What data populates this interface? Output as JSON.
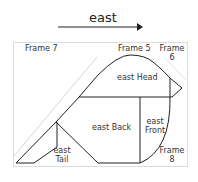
{
  "direction": {
    "label": "east"
  },
  "frames": {
    "frame7": "Frame 7",
    "frame5": "Frame 5",
    "frame6_line1": "Frame",
    "frame6_line2": "6",
    "frame8_line1": "Frame",
    "frame8_line2": "8"
  },
  "regions": {
    "head": "east Head",
    "back": "east Back",
    "front_line1": "east",
    "front_line2": "Front",
    "tail_line1": "east",
    "tail_line2": "Tail"
  },
  "colors": {
    "stroke": "#222222",
    "frame_border": "#d8d8d8",
    "light_diagonal": "#d0d0d0",
    "text": "#333333"
  }
}
